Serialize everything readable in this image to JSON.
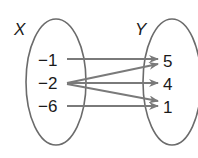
{
  "diagram": {
    "type": "mapping-diagram",
    "domain_set": {
      "label": "X",
      "elements": [
        "−1",
        "−2",
        "−6"
      ]
    },
    "range_set": {
      "label": "Y",
      "elements": [
        "5",
        "4",
        "1"
      ]
    },
    "mappings": [
      {
        "from": "−1",
        "to": "5"
      },
      {
        "from": "−2",
        "to": "5"
      },
      {
        "from": "−2",
        "to": "4"
      },
      {
        "from": "−2",
        "to": "1"
      },
      {
        "from": "−6",
        "to": "1"
      }
    ],
    "colors": {
      "ellipse_stroke": "#6b6b6b",
      "arrow": "#7a7a7a",
      "text": "#1a1a1a"
    }
  }
}
